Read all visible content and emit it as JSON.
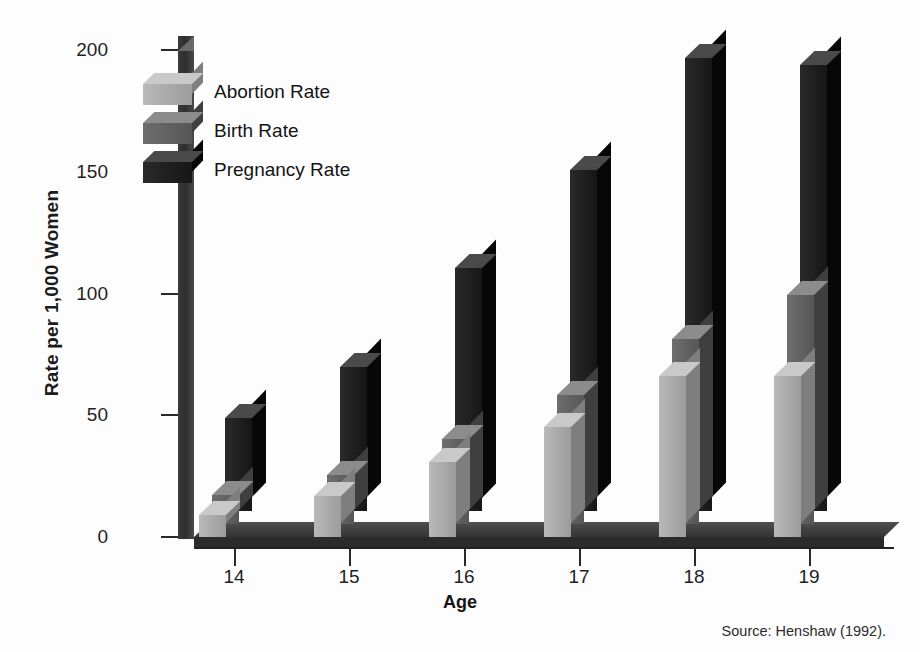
{
  "chart_data": {
    "type": "bar",
    "title": "",
    "subtitle": "",
    "xlabel": "Age",
    "ylabel": "Rate per 1,000 Women",
    "categories": [
      "14",
      "15",
      "16",
      "17",
      "18",
      "19"
    ],
    "ylim": [
      0,
      200
    ],
    "yticks": [
      0,
      50,
      100,
      150,
      200
    ],
    "ytick_labels": [
      "0",
      "50",
      "100",
      "150",
      "200"
    ],
    "grid": false,
    "legend_position": "top-left",
    "style": "3d-grouped-bars",
    "series": [
      {
        "name": "Abortion Rate",
        "color": "#a8a8a8",
        "values": [
          9,
          17,
          31,
          45,
          66,
          66
        ]
      },
      {
        "name": "Birth Rate",
        "color": "#5a5a5a",
        "values": [
          12,
          20,
          35,
          53,
          76,
          94
        ]
      },
      {
        "name": "Pregnancy Rate",
        "color": "#1a1a1a",
        "values": [
          38,
          59,
          100,
          140,
          186,
          183
        ]
      }
    ],
    "source": "Source: Henshaw (1992)."
  },
  "legend": {
    "items": [
      {
        "label": "Abortion Rate"
      },
      {
        "label": "Birth Rate"
      },
      {
        "label": "Pregnancy Rate"
      }
    ]
  },
  "axes": {
    "y_title": "Rate per 1,000 Women",
    "x_title": "Age",
    "y_ticks": [
      "200",
      "150",
      "100",
      "50",
      "0"
    ],
    "x_ticks": [
      "14",
      "15",
      "16",
      "17",
      "18",
      "19"
    ]
  },
  "footer": {
    "source": "Source: Henshaw (1992)."
  },
  "colors": {
    "abortion": "#a8a8a8",
    "birth": "#5a5a5a",
    "pregnancy": "#1a1a1a",
    "axis": "#2a2a2a",
    "background": "#fdfdfd"
  }
}
